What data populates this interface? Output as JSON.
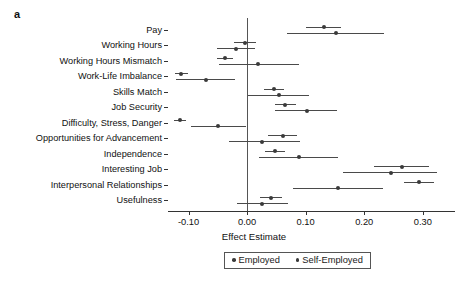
{
  "panel": {
    "label": "a"
  },
  "legend": {
    "items": [
      {
        "label": "Employed",
        "color": "#3a3a3a",
        "marker": "filled-circle"
      },
      {
        "label": "Self-Employed",
        "color": "#3a3a3a",
        "marker": "filled-circle"
      }
    ]
  },
  "chart_data": {
    "type": "scatter",
    "subtype": "forest-plot",
    "title": "",
    "xlabel": "Effect Estimate",
    "ylabel": "",
    "xlim": [
      -0.135,
      0.355
    ],
    "xticks": [
      -0.1,
      0.0,
      0.1,
      0.2,
      0.3
    ],
    "xticklabels": [
      "-0.10",
      "0.00",
      "0.10",
      "0.20",
      "0.30"
    ],
    "grid": false,
    "reference_line": 0.0,
    "legend_position": "bottom",
    "categories": [
      "Pay",
      "Working Hours",
      "Working Hours Mismatch",
      "Work-Life Imbalance",
      "Skills Match",
      "Job Security",
      "Difficulty, Stress, Danger",
      "Opportunities for Advancement",
      "Independence",
      "Interesting Job",
      "Interpersonal Relationships",
      "Usefulness"
    ],
    "series": [
      {
        "name": "Employed",
        "values": [
          0.131,
          -0.003,
          -0.037,
          -0.112,
          0.046,
          0.065,
          -0.114,
          0.061,
          0.047,
          0.264,
          0.293,
          0.04
        ],
        "ci_low": [
          0.1,
          -0.022,
          -0.051,
          -0.123,
          0.029,
          0.048,
          -0.125,
          0.036,
          0.03,
          0.216,
          0.268,
          0.022
        ],
        "ci_high": [
          0.161,
          0.015,
          -0.024,
          -0.1,
          0.063,
          0.083,
          -0.104,
          0.086,
          0.064,
          0.311,
          0.32,
          0.059
        ]
      },
      {
        "name": "Self-Employed",
        "values": [
          0.152,
          -0.019,
          0.018,
          -0.07,
          0.054,
          0.103,
          -0.049,
          0.026,
          0.089,
          0.245,
          0.155,
          0.026
        ],
        "ci_low": [
          0.068,
          -0.051,
          -0.048,
          -0.122,
          0.002,
          0.048,
          -0.096,
          -0.031,
          0.021,
          0.164,
          0.078,
          -0.017
        ],
        "ci_high": [
          0.233,
          0.014,
          0.088,
          -0.021,
          0.106,
          0.153,
          -0.001,
          0.09,
          0.155,
          0.325,
          0.232,
          0.07
        ]
      }
    ]
  }
}
